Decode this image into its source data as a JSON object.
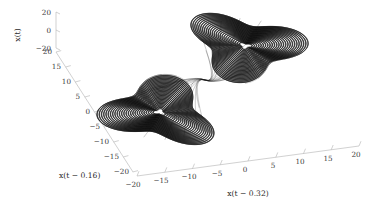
{
  "figure": {
    "background": "#ffffff",
    "axis_color": "#b2b2b2",
    "curve_color": "#101010"
  },
  "axes": {
    "vertical": {
      "name": "x(t)",
      "label": "x(t)",
      "ticks": [
        "20",
        "0",
        "−20"
      ]
    },
    "left_depth": {
      "name": "x(t-0.16)",
      "label": "x(t − 0.16)",
      "ticks": [
        "20",
        "15",
        "10",
        "5",
        "0",
        "−5",
        "−10",
        "−15",
        "−20"
      ]
    },
    "bottom_right": {
      "name": "x(t-0.32)",
      "label": "x(t − 0.32)",
      "ticks": [
        "−20",
        "−15",
        "−10",
        "−5",
        "0",
        "5",
        "10",
        "15",
        "20"
      ]
    }
  },
  "chart_data": {
    "type": "line",
    "title": "",
    "xlabel": "x(t − 0.32)",
    "ylabel": "x(t − 0.16)",
    "zlabel": "x(t)",
    "projection": "3d-delay-embedding",
    "grid": false,
    "legend": null,
    "xlim": [
      -20,
      20
    ],
    "ylim": [
      -20,
      20
    ],
    "zlim": [
      -20,
      20
    ],
    "xticks": [
      -20,
      -15,
      -10,
      -5,
      0,
      5,
      10,
      15,
      20
    ],
    "yticks": [
      -20,
      -15,
      -10,
      -5,
      0,
      5,
      10,
      15,
      20
    ],
    "zticks": [
      -20,
      0,
      20
    ],
    "series": [
      {
        "name": "trajectory",
        "color": "#101010",
        "lobes": [
          {
            "name": "upper-right-lobe",
            "center_px": [
              245,
              46
            ],
            "turns": 26
          },
          {
            "name": "lower-left-lobe",
            "center_px": [
              160,
              112
            ],
            "turns": 26
          }
        ],
        "saddle_px": [
          205,
          80
        ]
      }
    ]
  }
}
